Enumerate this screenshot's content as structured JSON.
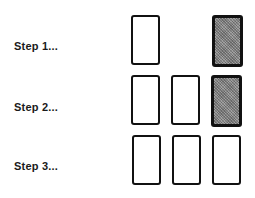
{
  "steps": [
    {
      "label": "Step 1...",
      "cards": [
        {
          "position": 1,
          "state": "face-up"
        },
        {
          "position": 3,
          "state": "face-down"
        }
      ]
    },
    {
      "label": "Step 2...",
      "cards": [
        {
          "position": 1,
          "state": "face-up"
        },
        {
          "position": 2,
          "state": "face-up"
        },
        {
          "position": 3,
          "state": "face-down"
        }
      ]
    },
    {
      "label": "Step 3...",
      "cards": [
        {
          "position": 1,
          "state": "face-up"
        },
        {
          "position": 2,
          "state": "face-up"
        },
        {
          "position": 3,
          "state": "face-up"
        }
      ]
    }
  ],
  "colors": {
    "card_border": "#111111",
    "face_down_fill": "#8a8a8a",
    "face_up_fill": "#ffffff"
  }
}
